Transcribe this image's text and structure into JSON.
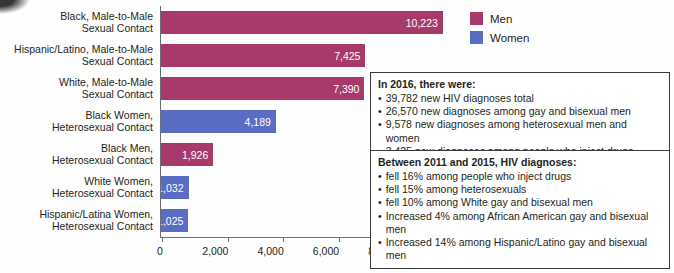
{
  "colors": {
    "men": "#a8396b",
    "women": "#5b6cc4",
    "axis": "#6d6e71",
    "text": "#231f20",
    "box_border": "#3b3b3b",
    "background": "#fefefe"
  },
  "legend": {
    "items": [
      {
        "label": "Men",
        "color": "#a8396b",
        "swatch_name": "men-swatch"
      },
      {
        "label": "Women",
        "color": "#5b6cc4",
        "swatch_name": "women-swatch"
      }
    ]
  },
  "callouts": [
    {
      "id": "callout-2016",
      "title": "In 2016, there were:",
      "items": [
        "39,782 new HIV diagnoses total",
        "26,570 new diagnoses among gay and bisexual men",
        "9,578 new diagnoses among heterosexual men and women",
        "3,425 new diagnoses among people who inject drugs"
      ]
    },
    {
      "id": "callout-trend",
      "title": "Between 2011 and 2015, HIV diagnoses:",
      "items": [
        "fell 16% among people who inject drugs",
        "fell 15% among heterosexuals",
        "fell 10% among White gay and bisexual men",
        "Increased 4% among African American gay and bisexual men",
        "Increased 14% among Hispanic/Latino gay and bisexual men"
      ]
    }
  ],
  "chart_data": {
    "type": "bar",
    "orientation": "horizontal",
    "title": "",
    "xlabel": "",
    "ylabel": "",
    "xlim": [
      0,
      12000
    ],
    "xticks": [
      0,
      2000,
      4000,
      6000,
      8000,
      10000,
      12000
    ],
    "xtick_labels": [
      "0",
      "2,000",
      "4,000",
      "6,000",
      "8,000",
      "10,000",
      "12,000"
    ],
    "grid": false,
    "legend_position": "top-right",
    "categories": [
      "Black, Male-to-Male Sexual Contact",
      "Hispanic/Latino, Male-to-Male Sexual Contact",
      "White, Male-to-Male Sexual Contact",
      "Black Women, Heterosexual Contact",
      "Black Men, Heterosexual Contact",
      "White Women, Heterosexual Contact",
      "Hispanic/Latina Women, Heterosexual Contact"
    ],
    "bars": [
      {
        "line1": "Black, Male-to-Male",
        "line2": "Sexual Contact",
        "value": 10223,
        "label": "10,223",
        "group": "Men"
      },
      {
        "line1": "Hispanic/Latino, Male-to-Male",
        "line2": "Sexual Contact",
        "value": 7425,
        "label": "7,425",
        "group": "Men"
      },
      {
        "line1": "White, Male-to-Male",
        "line2": "Sexual Contact",
        "value": 7390,
        "label": "7,390",
        "group": "Men"
      },
      {
        "line1": "Black Women,",
        "line2": "Heterosexual Contact",
        "value": 4189,
        "label": "4,189",
        "group": "Women"
      },
      {
        "line1": "Black Men,",
        "line2": "Heterosexual Contact",
        "value": 1926,
        "label": "1,926",
        "group": "Men"
      },
      {
        "line1": "White Women,",
        "line2": "Heterosexual Contact",
        "value": 1032,
        "label": "1,032",
        "group": "Women"
      },
      {
        "line1": "Hispanic/Latina Women,",
        "line2": "Heterosexual Contact",
        "value": 1025,
        "label": "1,025",
        "group": "Women"
      }
    ],
    "series": [
      {
        "name": "Men",
        "values": [
          10223,
          7425,
          7390,
          null,
          1926,
          null,
          null
        ]
      },
      {
        "name": "Women",
        "values": [
          null,
          null,
          null,
          4189,
          null,
          1032,
          1025
        ]
      }
    ]
  }
}
